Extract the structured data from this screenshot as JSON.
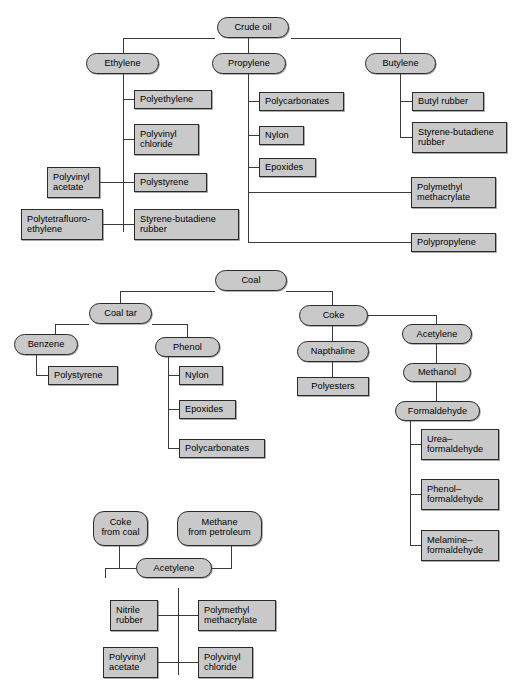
{
  "diagram": {
    "style": {
      "node_fill": "#c9c9c9",
      "node_border": "#2b2b2b",
      "line_color": "#3a3a3a",
      "background": "#ffffff",
      "text_color": "#000000"
    }
  },
  "charts": [
    {
      "id": "crude-oil",
      "root": "Crude oil",
      "branches": [
        {
          "name": "Ethylene",
          "products": [
            "Polyethylene",
            "Polyvinyl chloride",
            "Polystyrene",
            "Styrene-butadiene rubber"
          ],
          "left_products": [
            "Polyvinyl acetate",
            "Polytetrafluoro- ethylene"
          ]
        },
        {
          "name": "Propylene",
          "products": [
            "Polycarbonates",
            "Nylon",
            "Epoxides",
            "Polymethyl methacrylate",
            "Polypropylene"
          ]
        },
        {
          "name": "Butylene",
          "products": [
            "Butyl rubber",
            "Styrene-butadiene rubber"
          ]
        }
      ]
    },
    {
      "id": "coal",
      "root": "Coal",
      "branches": [
        {
          "name": "Coal tar",
          "sub": [
            {
              "name": "Benzene",
              "products": [
                "Polystyrene"
              ]
            },
            {
              "name": "Phenol",
              "products": [
                "Nylon",
                "Epoxides",
                "Polycarbonates"
              ]
            }
          ]
        },
        {
          "name": "Coke",
          "chain": [
            "Napthaline",
            "Polyesters"
          ],
          "sub": [
            {
              "name": "Acetylene",
              "chain": [
                "Methanol",
                "Formaldehyde"
              ],
              "products": [
                "Urea– formaldehyde",
                "Phenol– formaldehyde",
                "Melamine– formaldehyde"
              ]
            }
          ]
        }
      ]
    },
    {
      "id": "acetylene",
      "sources": [
        "Coke from coal",
        "Methane from petroleum"
      ],
      "hub": "Acetylene",
      "products": [
        "Nitrile rubber",
        "Polymethyl methacrylate",
        "Polyvinyl acetate",
        "Polyvinyl chloride"
      ]
    }
  ],
  "labels": {
    "crude_oil": "Crude oil",
    "ethylene": "Ethylene",
    "propylene": "Propylene",
    "butylene": "Butylene",
    "polyethylene": "Polyethylene",
    "polyvinyl_chloride_l1": "Polyvinyl",
    "polyvinyl_chloride_l2": "chloride",
    "polystyrene": "Polystyrene",
    "sbr_l1": "Styrene-butadiene",
    "sbr_l2": "rubber",
    "polyvinyl_acetate_l1": "Polyvinyl",
    "polyvinyl_acetate_l2": "acetate",
    "ptfe_l1": "Polytetrafluoro-",
    "ptfe_l2": "ethylene",
    "polycarbonates": "Polycarbonates",
    "nylon": "Nylon",
    "epoxides": "Epoxides",
    "pmma_l1": "Polymethyl",
    "pmma_l2": "methacrylate",
    "polypropylene": "Polypropylene",
    "butyl_rubber": "Butyl rubber",
    "sbr2_l1": "Styrene-butadiene",
    "sbr2_l2": "rubber",
    "coal": "Coal",
    "coal_tar": "Coal tar",
    "benzene": "Benzene",
    "phenol": "Phenol",
    "polystyrene2": "Polystyrene",
    "nylon2": "Nylon",
    "epoxides2": "Epoxides",
    "polycarbonates2": "Polycarbonates",
    "coke": "Coke",
    "napthaline": "Napthaline",
    "polyesters": "Polyesters",
    "acetylene": "Acetylene",
    "methanol": "Methanol",
    "formaldehyde": "Formaldehyde",
    "urea_l1": "Urea–",
    "urea_l2": "formaldehyde",
    "phenolf_l1": "Phenol–",
    "phenolf_l2": "formaldehyde",
    "melamine_l1": "Melamine–",
    "melamine_l2": "formaldehyde",
    "coke_coal_l1": "Coke",
    "coke_coal_l2": "from coal",
    "methane_l1": "Methane",
    "methane_l2": "from petroleum",
    "acetylene3": "Acetylene",
    "nitrile_l1": "Nitrile",
    "nitrile_l2": "rubber",
    "pmma3_l1": "Polymethyl",
    "pmma3_l2": "methacrylate",
    "pva3_l1": "Polyvinyl",
    "pva3_l2": "acetate",
    "pvc3_l1": "Polyvinyl",
    "pvc3_l2": "chloride"
  }
}
